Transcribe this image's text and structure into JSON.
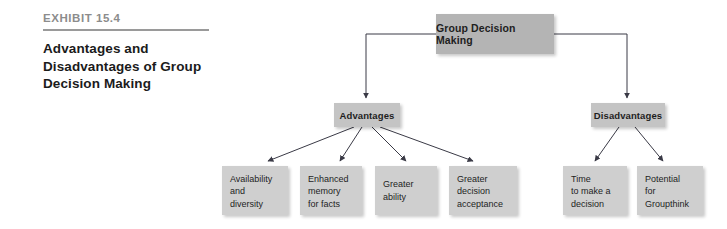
{
  "caption": {
    "exhibit_label": "EXHIBIT 15.4",
    "title_lines": [
      "Advantages and",
      "Disadvantages of Group",
      "Decision Making"
    ]
  },
  "colors": {
    "root_fill": "#b4b4b4",
    "branch_fill": "#c4c4c4",
    "leaf_fill": "#cfcfcf",
    "connector": "#3a3a46",
    "rule": "#9a9a9a",
    "label_gray": "#8c8c8c",
    "text": "#1e1e1e",
    "background": "#ffffff"
  },
  "diagram": {
    "type": "tree",
    "root": {
      "label": "Group Decision Making"
    },
    "branches": [
      {
        "label": "Advantages"
      },
      {
        "label": "Disadvantages"
      }
    ],
    "advantages_leaves": [
      {
        "lines": [
          "Availability",
          "and",
          "diversity"
        ]
      },
      {
        "lines": [
          "Enhanced",
          "memory",
          "for facts"
        ]
      },
      {
        "lines": [
          "Greater",
          "ability"
        ]
      },
      {
        "lines": [
          "Greater",
          "decision",
          "acceptance"
        ]
      }
    ],
    "disadvantages_leaves": [
      {
        "lines": [
          "Time",
          "to make a",
          "decision"
        ]
      },
      {
        "lines": [
          "Potential",
          "for",
          "Groupthink"
        ]
      }
    ]
  }
}
